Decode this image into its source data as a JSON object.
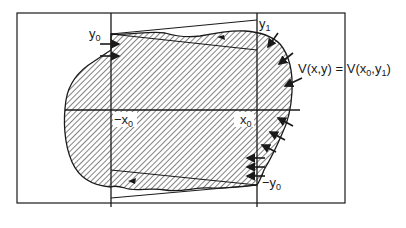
{
  "diagram": {
    "labels": {
      "y0": {
        "base": "y",
        "sub": "0"
      },
      "y1": {
        "base": "y",
        "sub": "1"
      },
      "neg_x0": {
        "base": "−x",
        "sub": "0"
      },
      "x0": {
        "base": "x",
        "sub": "0"
      },
      "neg_y0": {
        "base": "−y",
        "sub": "0"
      },
      "equation": {
        "part1": "V(x,y) = V(x",
        "sub0": "0",
        "part2": ",y",
        "sub1": "1",
        "part3": ")"
      }
    },
    "colors": {
      "ink": "#1a1a1a",
      "background": "#ffffff"
    }
  }
}
